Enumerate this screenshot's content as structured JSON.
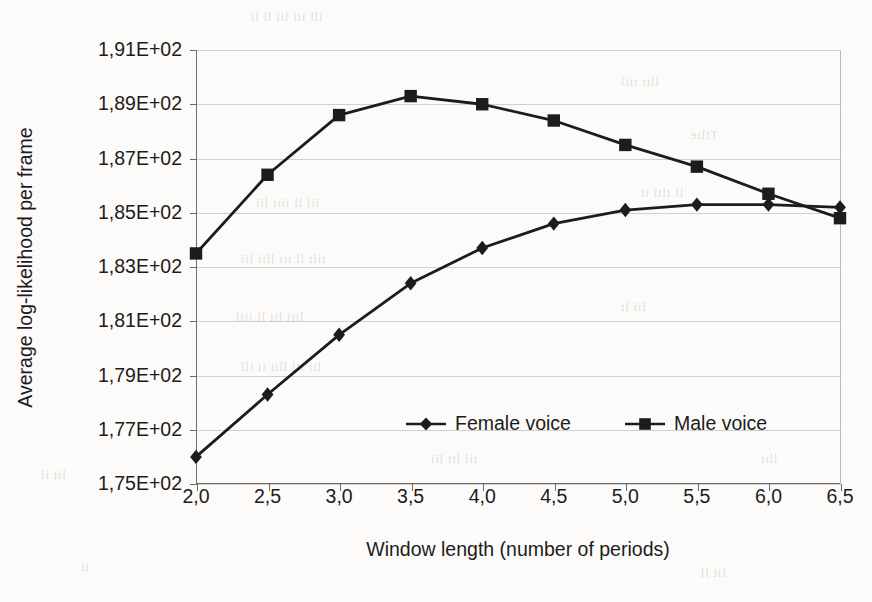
{
  "figure": {
    "background_color": "#fcfbf9",
    "ink_color": "#1c1c1c",
    "grid_color": "#cfcfcf",
    "axis_color": "#6d6d6d"
  },
  "chart_data": {
    "type": "line",
    "title": "",
    "xlabel": "Window length (number of periods)",
    "ylabel": "Average log-likelihood per frame",
    "categories": [
      "2,0",
      "2,5",
      "3,0",
      "3,5",
      "4,0",
      "4,5",
      "5,0",
      "5,5",
      "6,0",
      "6,5"
    ],
    "x": [
      2.0,
      2.5,
      3.0,
      3.5,
      4.0,
      4.5,
      5.0,
      5.5,
      6.0,
      6.5
    ],
    "xlim": [
      2.0,
      6.5
    ],
    "ylim": [
      175,
      191
    ],
    "ytick_labels": [
      "1,91E+02",
      "1,89E+02",
      "1,87E+02",
      "1,85E+02",
      "1,83E+02",
      "1,81E+02",
      "1,79E+02",
      "1,77E+02",
      "1,75E+02"
    ],
    "ytick_values": [
      191,
      189,
      187,
      185,
      183,
      181,
      179,
      177,
      175
    ],
    "grid": true,
    "grid_axis": "y",
    "legend_position": "inside-lower-center",
    "series": [
      {
        "name": "Female voice",
        "marker": "diamond",
        "color": "#1c1c1c",
        "values": [
          176.0,
          178.3,
          180.5,
          182.4,
          183.7,
          184.6,
          185.1,
          185.3,
          185.3,
          185.2
        ]
      },
      {
        "name": "Male voice",
        "marker": "square",
        "color": "#1c1c1c",
        "values": [
          183.5,
          186.4,
          188.6,
          189.3,
          189.0,
          188.4,
          187.5,
          186.7,
          185.7,
          184.8
        ]
      }
    ]
  },
  "legend": {
    "items": [
      {
        "label": "Female voice",
        "marker": "diamond"
      },
      {
        "label": "Male voice",
        "marker": "square"
      }
    ]
  },
  "scan_artifacts": {
    "note": "faint mirrored show-through from reverse page",
    "marks": [
      "1,91E+02",
      "rift",
      "nil",
      "tin",
      "ii",
      "lll",
      "it",
      "ll",
      "ii",
      "tt",
      "l.",
      "ll",
      "it"
    ]
  }
}
